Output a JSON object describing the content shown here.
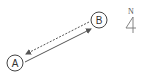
{
  "diagram": {
    "nodes": [
      {
        "id": "A",
        "label": "A",
        "cx": 15,
        "cy": 63,
        "r": 8
      },
      {
        "id": "B",
        "label": "B",
        "cx": 99,
        "cy": 20,
        "r": 8
      }
    ],
    "edges": [
      {
        "from": "A",
        "to": "B",
        "style": "solid"
      },
      {
        "from": "B",
        "to": "A",
        "style": "dashed"
      }
    ],
    "north_arrow": {
      "label": "N"
    },
    "colors": {
      "stroke": "#555555",
      "text": "#333333"
    }
  }
}
